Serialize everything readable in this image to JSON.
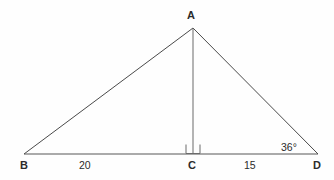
{
  "figure": {
    "kind": "geometry-diagram",
    "background_color": "#fefefe",
    "line_color": "#4a4a4a",
    "text_color": "#2b2b2b"
  },
  "vertices": {
    "A": {
      "label": "A",
      "x": 193,
      "y": 28
    },
    "B": {
      "label": "B",
      "x": 24,
      "y": 154
    },
    "C": {
      "label": "C",
      "x": 193,
      "y": 154
    },
    "D": {
      "label": "D",
      "x": 318,
      "y": 154
    }
  },
  "segments": [
    {
      "name": "AB",
      "from": "A",
      "to": "B"
    },
    {
      "name": "AD",
      "from": "A",
      "to": "D"
    },
    {
      "name": "BD",
      "from": "B",
      "to": "D"
    },
    {
      "name": "AC",
      "from": "A",
      "to": "C"
    }
  ],
  "measures": {
    "BC": "20",
    "CD": "15"
  },
  "angles": {
    "at_D": "36°",
    "at_C": "right angle"
  },
  "marks": {
    "right_angle_at_C": true
  }
}
